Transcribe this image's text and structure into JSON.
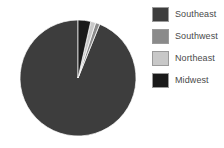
{
  "chart_data": {
    "type": "pie",
    "title": "",
    "labels": [
      "Southeast",
      "Southwest",
      "Northeast",
      "Midwest"
    ],
    "values": [
      93.5,
      1.2,
      1.4,
      3.9
    ],
    "units": "percent",
    "colors": [
      "#3d3d3d",
      "#8a8a8a",
      "#c8c8c8",
      "#1a1a1a"
    ],
    "start_angle_deg": 0,
    "direction": "clockwise",
    "slices": [
      {
        "label": "Southeast",
        "value": 93.5,
        "color": "#3d3d3d",
        "start_deg": 22.0,
        "end_deg": 360.0
      },
      {
        "label": "Southwest",
        "value": 1.2,
        "color": "#8a8a8a",
        "start_deg": 17.7,
        "end_deg": 22.0
      },
      {
        "label": "Northeast",
        "value": 1.4,
        "color": "#c8c8c8",
        "start_deg": 12.7,
        "end_deg": 17.7
      },
      {
        "label": "Midwest",
        "value": 3.9,
        "color": "#1a1a1a",
        "start_deg": 0.0,
        "end_deg": 12.7
      }
    ],
    "legend": {
      "position": "right",
      "entries": [
        {
          "label": "Southeast",
          "color": "#3d3d3d"
        },
        {
          "label": "Southwest",
          "color": "#8a8a8a"
        },
        {
          "label": "Northeast",
          "color": "#c8c8c8"
        },
        {
          "label": "Midwest",
          "color": "#1a1a1a"
        }
      ]
    },
    "geometry": {
      "cx": 78,
      "cy": 78,
      "r": 58
    },
    "grid": false,
    "xlabel": "",
    "ylabel": ""
  }
}
